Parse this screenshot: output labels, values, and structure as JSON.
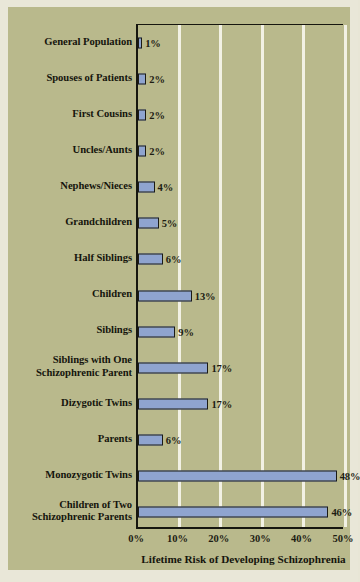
{
  "chart_data": {
    "type": "bar",
    "orientation": "horizontal",
    "title": "",
    "xlabel": "Lifetime Risk of Developing Schizophrenia",
    "ylabel": "",
    "xlim": [
      0,
      50
    ],
    "xticks": [
      "0%",
      "10%",
      "20%",
      "30%",
      "40%",
      "50%"
    ],
    "xtick_values": [
      0,
      10,
      20,
      30,
      40,
      50
    ],
    "grid": "vertical",
    "legend": "none",
    "categories": [
      "General Population",
      "Spouses of Patients",
      "First Cousins",
      "Uncles/Aunts",
      "Nephews/Nieces",
      "Grandchildren",
      "Half Siblings",
      "Children",
      "Siblings",
      "Siblings with One Schizophrenic Parent",
      "Dizygotic Twins",
      "Parents",
      "Monozygotic Twins",
      "Children of Two Schizophrenic Parents"
    ],
    "category_lines": [
      [
        "General Population"
      ],
      [
        "Spouses of Patients"
      ],
      [
        "First Cousins"
      ],
      [
        "Uncles/Aunts"
      ],
      [
        "Nephews/Nieces"
      ],
      [
        "Grandchildren"
      ],
      [
        "Half Siblings"
      ],
      [
        "Children"
      ],
      [
        "Siblings"
      ],
      [
        "Siblings with One",
        "Schizophrenic Parent"
      ],
      [
        "Dizygotic Twins"
      ],
      [
        "Parents"
      ],
      [
        "Monozygotic Twins"
      ],
      [
        "Children of Two",
        "Schizophrenic Parents"
      ]
    ],
    "values": [
      1,
      2,
      2,
      2,
      4,
      5,
      6,
      13,
      9,
      17,
      17,
      6,
      48,
      46
    ],
    "value_labels": [
      "1%",
      "2%",
      "2%",
      "2%",
      "4%",
      "5%",
      "6%",
      "13%",
      "9%",
      "17%",
      "17%",
      "6%",
      "48%",
      "46%"
    ]
  },
  "colors": {
    "background": "#e9e7d8",
    "canvas": "#b9b98c",
    "bar_fill": "#8fa4cf",
    "bar_edge": "#1b1b14",
    "gridline": "#f2f1e4",
    "text": "#15150d",
    "axis": "#16160f"
  }
}
